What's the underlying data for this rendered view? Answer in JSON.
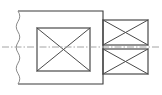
{
  "document": {
    "kind": "engineering-drawing",
    "view_name": "sectional-side-view",
    "width_px": 162,
    "height_px": 95,
    "background_color": "#ffffff"
  },
  "style": {
    "outline_color": "#3a3a3a",
    "outline_width": 1.1,
    "detail_color": "#4a4a4a",
    "detail_width": 1.0,
    "break_line_color": "#8a8a8a",
    "break_line_width": 1.0,
    "centerline_color": "#9a9a9a",
    "centerline_width": 0.9,
    "centerline_dash_pattern": "7 2 1.5 2"
  },
  "geometry": {
    "centerline": {
      "label": "axis-centerline",
      "y": 47,
      "x_start": 2,
      "x_end": 159
    },
    "break_line": {
      "label": "wavy-break-line",
      "x_nominal": 18,
      "y_top": 11,
      "y_bottom": 84,
      "amplitude": 3.5
    },
    "main_body": {
      "label": "main-body-outline",
      "x": 18,
      "y": 11,
      "width": 85,
      "height": 73
    },
    "inner_box": {
      "label": "inner-bore-section",
      "x": 37,
      "y": 28,
      "width": 53,
      "height": 43,
      "has_cross": true
    },
    "flange_boxes": [
      {
        "label": "upper-flange-section",
        "x": 103,
        "y": 20,
        "width": 45,
        "height": 25,
        "has_cross": true
      },
      {
        "label": "lower-flange-section",
        "x": 103,
        "y": 49,
        "width": 45,
        "height": 25,
        "has_cross": true
      }
    ]
  },
  "labels": {
    "title": "",
    "annotations": []
  }
}
